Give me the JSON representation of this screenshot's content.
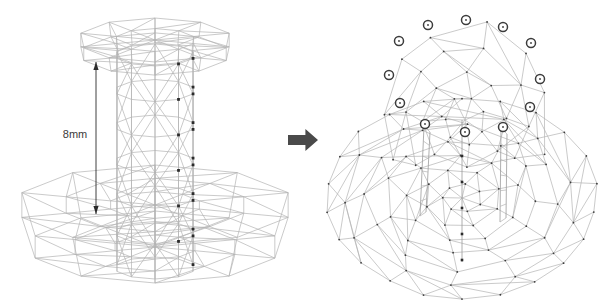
{
  "figure": {
    "background_color": "#ffffff",
    "mesh_line_color": "#b3b3b3",
    "node_color": "#3a3a3a",
    "marker_ring_color": "#3c3c3c",
    "arrow_color": "#4a4a4a"
  },
  "left_panel": {
    "name": "source-mesh-cylinder-on-disk",
    "dimension": {
      "label": "8mm",
      "value": 8,
      "unit": "mm",
      "measures": "cylinder height",
      "label_x": 75,
      "label_y": 135,
      "line_x": 96,
      "line_top_y": 62,
      "line_bottom_y": 214
    },
    "cylinder": {
      "center_x": 155,
      "top_y": 55,
      "bottom_y": 268,
      "radius_x": 40,
      "radius_y": 11,
      "sides": 10,
      "ring_rows": 6
    },
    "top_flange": {
      "center_x": 155,
      "center_y": 40,
      "radius_x": 78,
      "radius_y": 22,
      "thickness": 14,
      "sides": 10
    },
    "base_disk": {
      "center_x": 155,
      "center_y": 205,
      "radius_x": 140,
      "radius_y": 40,
      "thickness": 42,
      "sides": 10,
      "rings": 3
    }
  },
  "transform_arrow": {
    "name": "transform-arrow",
    "direction": "right",
    "x": 288,
    "y": 129,
    "width": 30,
    "height": 22
  },
  "right_panel": {
    "name": "result-mesh-triangulated-dome",
    "dome": {
      "center_x": 462,
      "center_y": 198,
      "radius_x": 135,
      "radius_y": 100
    },
    "markers": {
      "count": 12,
      "radius": 4.5,
      "note": "ring of highlighted boundary nodes around the hole",
      "positions": [
        {
          "x": 428,
          "y": 25
        },
        {
          "x": 466,
          "y": 20
        },
        {
          "x": 503,
          "y": 27
        },
        {
          "x": 399,
          "y": 41
        },
        {
          "x": 531,
          "y": 43
        },
        {
          "x": 389,
          "y": 75
        },
        {
          "x": 540,
          "y": 79
        },
        {
          "x": 400,
          "y": 103
        },
        {
          "x": 530,
          "y": 107
        },
        {
          "x": 425,
          "y": 124
        },
        {
          "x": 503,
          "y": 127
        },
        {
          "x": 465,
          "y": 132
        }
      ]
    }
  }
}
